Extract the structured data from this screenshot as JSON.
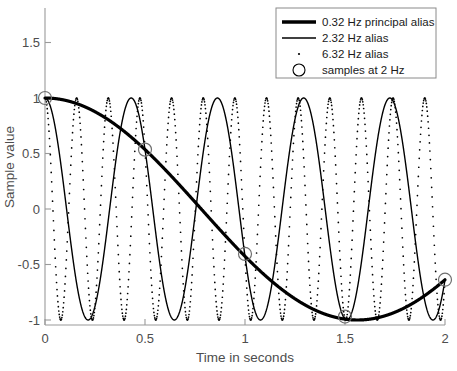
{
  "chart_data": {
    "type": "line",
    "title": "",
    "xlabel": "Time in seconds",
    "ylabel": "Sample value",
    "xlim": [
      0,
      2
    ],
    "ylim": [
      -1,
      1.75
    ],
    "xticks": [
      "0",
      "0.5",
      "1",
      "1.5",
      "2"
    ],
    "xtick_values": [
      0,
      0.5,
      1,
      1.5,
      2
    ],
    "yticks": [
      "1.5",
      "1",
      "0.5",
      "0",
      "-0.5",
      "-1"
    ],
    "ytick_values": [
      1.5,
      1,
      0.5,
      0,
      -0.5,
      -1
    ],
    "grid": false,
    "legend_position": "top-right",
    "series": [
      {
        "name": "0.32 Hz principal alias",
        "frequency_hz": 0.32,
        "style": "thick-solid",
        "color": "#000000",
        "linewidth": 3.2,
        "formula": "cos(2*pi*0.32*t)",
        "points": [
          {
            "t": 0.0,
            "y": 1.0
          },
          {
            "t": 0.25,
            "y": 0.876
          },
          {
            "t": 0.5,
            "y": 0.535
          },
          {
            "t": 0.75,
            "y": 0.068
          },
          {
            "t": 1.0,
            "y": -0.405
          },
          {
            "t": 1.25,
            "y": -0.771
          },
          {
            "t": 1.5,
            "y": -0.969
          },
          {
            "t": 1.75,
            "y": -0.969
          },
          {
            "t": 2.0,
            "y": -0.637
          }
        ]
      },
      {
        "name": "2.32 Hz alias",
        "frequency_hz": 2.32,
        "style": "thin-solid",
        "color": "#000000",
        "linewidth": 1.4,
        "formula": "cos(2*pi*2.32*t)"
      },
      {
        "name": "6.32 Hz alias",
        "frequency_hz": 6.32,
        "style": "dotted",
        "color": "#000000",
        "linewidth": 1.2,
        "formula": "cos(2*pi*6.32*t)"
      },
      {
        "name": "samples at 2 Hz",
        "style": "circle-markers",
        "color": "#000000",
        "sample_rate_hz": 2,
        "points": [
          {
            "t": 0.0,
            "y": 1.0
          },
          {
            "t": 0.5,
            "y": 0.535
          },
          {
            "t": 1.0,
            "y": -0.405
          },
          {
            "t": 1.5,
            "y": -0.969
          },
          {
            "t": 2.0,
            "y": -0.637
          }
        ]
      }
    ],
    "legend_entries": [
      {
        "label": "0.32 Hz principal alias",
        "marker": "thick-solid"
      },
      {
        "label": "2.32 Hz alias",
        "marker": "thin-solid"
      },
      {
        "label": "6.32 Hz alias",
        "marker": "dotted"
      },
      {
        "label": "samples at 2 Hz",
        "marker": "circle"
      }
    ]
  }
}
